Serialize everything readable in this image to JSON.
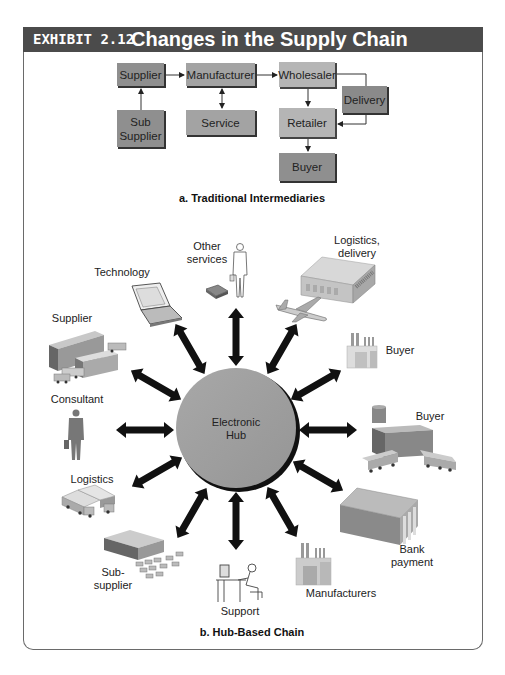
{
  "header": {
    "exhibit_label": "EXHIBIT 2.12",
    "title": "Changes in the Supply Chain"
  },
  "traditional": {
    "caption": "a. Traditional Intermediaries",
    "boxes": {
      "supplier": "Supplier",
      "manufacturer": "Manufacturer",
      "wholesaler": "Wholesaler",
      "delivery": "Delivery",
      "sub_supplier_1": "Sub",
      "sub_supplier_2": "Supplier",
      "service": "Service",
      "retailer": "Retailer",
      "buyer": "Buyer"
    },
    "colors": {
      "box_dark": "#8f8f8f",
      "box_light": "#b5b5b5"
    }
  },
  "hub": {
    "caption": "b. Hub-Based Chain",
    "center_1": "Electronic",
    "center_2": "Hub",
    "colors": {
      "hub_fill": "#9e9e9e",
      "arrow": "#111111"
    },
    "nodes": {
      "other_services_1": "Other",
      "other_services_2": "services",
      "logistics_delivery_1": "Logistics,",
      "logistics_delivery_2": "delivery",
      "technology": "Technology",
      "supplier": "Supplier",
      "buyer_top": "Buyer",
      "consultant": "Consultant",
      "buyer_right": "Buyer",
      "logistics": "Logistics",
      "bank_1": "Bank",
      "bank_2": "payment",
      "sub_supplier_1": "Sub-",
      "sub_supplier_2": "supplier",
      "support": "Support",
      "manufacturers": "Manufacturers"
    }
  }
}
